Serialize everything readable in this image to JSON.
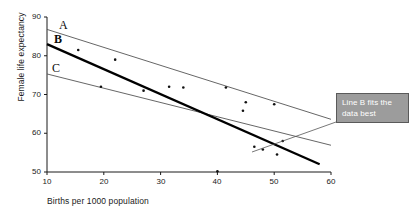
{
  "chart_data": {
    "type": "scatter",
    "title": "",
    "xlabel": "Births per 1000 population",
    "ylabel": "Female life expectancy",
    "xlim": [
      10,
      60
    ],
    "ylim": [
      50,
      90
    ],
    "xticks": [
      10,
      20,
      30,
      40,
      50,
      60
    ],
    "yticks": [
      50,
      60,
      70,
      80,
      90
    ],
    "grid": false,
    "legend": "none",
    "points": [
      {
        "x": 15.5,
        "y": 81.5
      },
      {
        "x": 19.5,
        "y": 72.0
      },
      {
        "x": 22.0,
        "y": 79.0
      },
      {
        "x": 27.0,
        "y": 71.0
      },
      {
        "x": 31.5,
        "y": 72.0
      },
      {
        "x": 34.0,
        "y": 71.8
      },
      {
        "x": 41.5,
        "y": 71.8
      },
      {
        "x": 44.5,
        "y": 65.8
      },
      {
        "x": 45.0,
        "y": 68.0
      },
      {
        "x": 46.5,
        "y": 56.5
      },
      {
        "x": 48.0,
        "y": 55.8
      },
      {
        "x": 50.0,
        "y": 67.5
      },
      {
        "x": 50.5,
        "y": 54.5
      },
      {
        "x": 51.5,
        "y": 58.0
      },
      {
        "x": 40.0,
        "y": 50.2
      }
    ],
    "series": [
      {
        "name": "A",
        "label": "A",
        "style": "thin",
        "x": [
          10,
          60
        ],
        "y": [
          86.8,
          63.6
        ]
      },
      {
        "name": "B",
        "label": "B",
        "style": "thick",
        "x": [
          10,
          58
        ],
        "y": [
          83.0,
          52.0
        ]
      },
      {
        "name": "C",
        "label": "C",
        "style": "thin",
        "x": [
          10,
          60
        ],
        "y": [
          75.3,
          56.9
        ]
      }
    ],
    "annotations": [
      {
        "name": "callout",
        "text_line1": "Line B fits the",
        "text_line2": "data best",
        "box_color": "#9c9c9c",
        "text_color": "#ffffff",
        "points_to_series": "B"
      }
    ],
    "colors": {
      "axis": "#1a1a1a",
      "line_a": "#555555",
      "line_b": "#000000",
      "line_c": "#555555",
      "point": "#111111",
      "callout_fill": "#9c9c9c",
      "callout_border": "#5a5a5a"
    }
  },
  "axes": {
    "y_label": "Female life expectancy",
    "x_label": "Births per 1000 population",
    "y_tick_labels": [
      "90",
      "80",
      "70",
      "60",
      "50"
    ],
    "x_tick_labels": [
      "10",
      "20",
      "30",
      "40",
      "50",
      "60"
    ]
  },
  "line_labels": {
    "a": "A",
    "b": "B",
    "c": "C"
  },
  "callout": {
    "line1": "Line B fits the",
    "line2": "data best"
  }
}
